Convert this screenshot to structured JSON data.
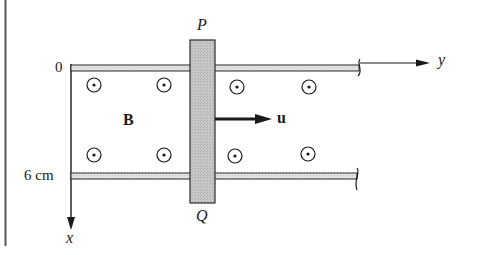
{
  "diagram": {
    "type": "rail-and-sliding-bar in magnetic field",
    "labels": {
      "bar_top": "P",
      "bar_bottom": "Q",
      "x_origin": "0",
      "x_mark": "6 cm",
      "y_axis": "y",
      "x_axis": "x",
      "field": "B",
      "velocity": "u"
    },
    "field_symbol": "dot-in-circle (out of page)",
    "field_symbol_count": 8,
    "colors": {
      "ink": "#1a1a1a",
      "rail_fill": "#dcdcdc",
      "bar_fill": "#c4c4c4",
      "border": "#555555"
    }
  }
}
